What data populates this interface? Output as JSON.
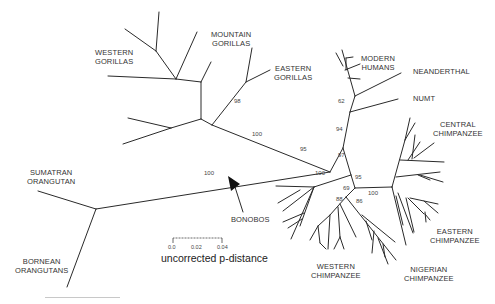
{
  "diagram": {
    "type": "unrooted phylogenetic tree",
    "taxa": {
      "western_gorillas": "WESTERN\nGORILLAS",
      "mountain_gorillas": "MOUNTAIN\nGORILLAS",
      "eastern_gorillas": "EASTERN\nGORILLAS",
      "modern_humans": "MODERN\nHUMANS",
      "neanderthal": "NEANDERTHAL",
      "numt": "NUMT",
      "central_chimpanzee": "CENTRAL\nCHIMPANZEE",
      "sumatran_orangutan": "SUMATRAN\nORANGUTAN",
      "bornean_orangutans": "BORNEAN\nORANGUTANS",
      "bonobos": "BONOBOS",
      "eastern_chimpanzee": "EASTERN\nCHIMPANZEE",
      "western_chimpanzee": "WESTERN\nCHIMPANZEE",
      "nigerian_chimpanzee": "NIGERIAN\nCHIMPANZEE"
    },
    "bootstrap": {
      "gorilla_mountain_eastern": "98",
      "gorilla_clade": "100",
      "human_neanderthal": "62",
      "human_numt": "94",
      "homo_pan": "95",
      "pan_split": "97",
      "orangutan_branch": "100",
      "bonobo_clade": "100",
      "chimp_clade": "95",
      "western_nigerian": "69",
      "western": "88",
      "nigerian": "86",
      "central_eastern": "100"
    },
    "scale": {
      "ticks": [
        "0.0",
        "0.02",
        "0.04"
      ],
      "label": "uncorrected p-distance"
    },
    "arrow_target": "BONOBOS"
  }
}
